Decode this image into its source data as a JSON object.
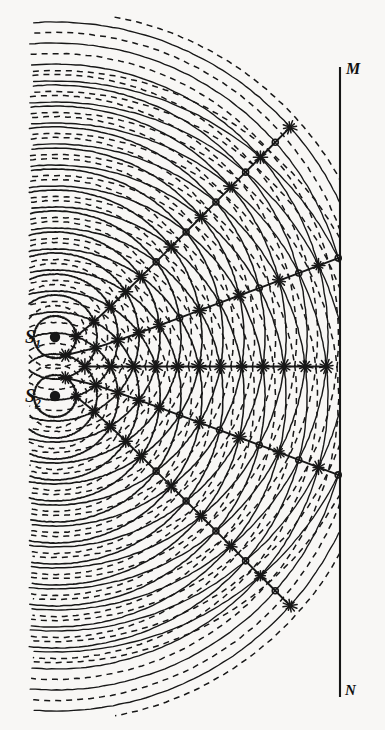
{
  "figure": {
    "background_color": "#f8f7f5",
    "ink_color": "#171717",
    "width": 385,
    "height": 730
  },
  "labels": {
    "source1": {
      "text": "S",
      "subscript": "1"
    },
    "source2": {
      "text": "S",
      "subscript": "2"
    },
    "screen_top": "M",
    "screen_bottom": "N"
  },
  "chart_data": {
    "type": "scatter",
    "xlabel": "",
    "ylabel": "",
    "grid": false,
    "legend": "none",
    "xlim": [
      0,
      385
    ],
    "ylim": [
      0,
      730
    ],
    "sources": [
      {
        "name": "S1",
        "x": 55,
        "y": 337,
        "dot_radius": 5.2
      },
      {
        "name": "S2",
        "x": 55,
        "y": 396,
        "dot_radius": 5.2
      }
    ],
    "source_separation_px": 59,
    "wavelength_px": 21,
    "crest_count_per_source": 17,
    "screen": {
      "name": "MN",
      "x": 340,
      "y_top": 68,
      "y_bottom": 696,
      "top_label": "M",
      "bottom_label": "N"
    },
    "central_axis_y": 366.5,
    "antinodal_orders": [
      0,
      1,
      2,
      3,
      4,
      5
    ],
    "antinodal_lines_note": "Order 0 is the straight horizontal central line; orders +/-1..+/-5 are hyperbolae opening to the right, symmetric about the central axis.",
    "pattern_extent": {
      "left": 33,
      "right": 340,
      "top": 22,
      "bottom": 710
    },
    "styles": {
      "crest": "solid",
      "trough": "dashed",
      "intersection_marker": "star"
    }
  }
}
